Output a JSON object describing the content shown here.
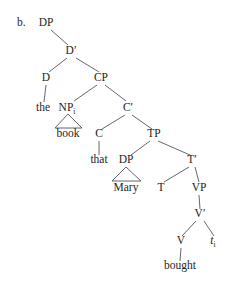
{
  "figure": {
    "item_letter": "b.",
    "type": "syntax-tree",
    "sentence": "the book that Mary bought"
  },
  "nodes": {
    "dp_top": {
      "label": "DP",
      "sub": "",
      "x": 46,
      "y": 26
    },
    "dbar": {
      "label": "D′",
      "sub": "",
      "x": 71,
      "y": 54
    },
    "d": {
      "label": "D",
      "sub": "",
      "x": 46,
      "y": 81
    },
    "cp": {
      "label": "CP",
      "sub": "",
      "x": 101,
      "y": 81
    },
    "the": {
      "label": "the",
      "sub": "",
      "x": 43,
      "y": 111
    },
    "np": {
      "label": "NP",
      "sub": "i",
      "x": 69,
      "y": 111
    },
    "cbar": {
      "label": "C′",
      "sub": "",
      "x": 128,
      "y": 111
    },
    "book": {
      "label": "book",
      "sub": "",
      "x": 68,
      "y": 137
    },
    "c": {
      "label": "C",
      "sub": "",
      "x": 99,
      "y": 137
    },
    "tp": {
      "label": "TP",
      "sub": "",
      "x": 154,
      "y": 137
    },
    "that": {
      "label": "that",
      "sub": "",
      "x": 99,
      "y": 163
    },
    "dp_subj": {
      "label": "DP",
      "sub": "",
      "x": 126,
      "y": 163
    },
    "tbar": {
      "label": "T′",
      "sub": "",
      "x": 192,
      "y": 163
    },
    "mary": {
      "label": "Mary",
      "sub": "",
      "x": 126,
      "y": 191
    },
    "t": {
      "label": "T",
      "sub": "",
      "x": 161,
      "y": 191
    },
    "vp": {
      "label": "VP",
      "sub": "",
      "x": 199,
      "y": 191
    },
    "vbar": {
      "label": "V′",
      "sub": "",
      "x": 200,
      "y": 217
    },
    "v": {
      "label": "V",
      "sub": "",
      "x": 181,
      "y": 244
    },
    "trace": {
      "label": "t",
      "sub": "i",
      "x": 215,
      "y": 244
    },
    "bought": {
      "label": "bought",
      "sub": "",
      "x": 180,
      "y": 269
    }
  },
  "style": {
    "line_color": "#55555b",
    "text_color": "#1e1e1e",
    "background": "#ffffff"
  }
}
